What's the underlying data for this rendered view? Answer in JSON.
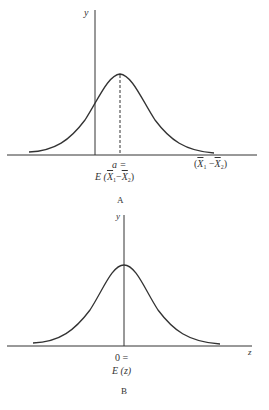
{
  "panels": [
    {
      "id": "A",
      "caption": "A",
      "y_axis_label": "y",
      "x_axis_label": {
        "pre": "(",
        "v1": "X",
        "s1": "1",
        "op": " −",
        "v2": "X",
        "s2": "2",
        "post": ")"
      },
      "mean_label_line1": "a =",
      "mean_label_line2": {
        "pre": "E (",
        "v1": "X",
        "s1": "1",
        "op": "−",
        "v2": "X",
        "s2": "2",
        "post": ")"
      },
      "mean_marker": "dashed"
    },
    {
      "id": "B",
      "caption": "B",
      "y_axis_label": "y",
      "x_axis_label": "z",
      "mean_label_line1": "0 =",
      "mean_label_line2": "E (z)"
    }
  ],
  "colors": {
    "line": "#333333",
    "background": "#ffffff"
  }
}
